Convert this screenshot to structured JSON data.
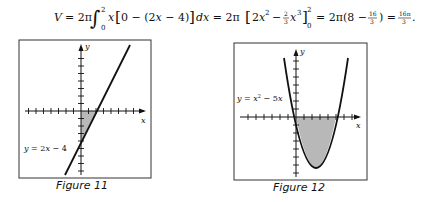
{
  "equation": {
    "lhs": "V",
    "parts": [
      "V = 2π",
      "∫",
      "2",
      "0",
      "x[0 − (2x − 4)] dx = 2π",
      "[2x",
      "2",
      " − ",
      "2",
      "3",
      "x",
      "3",
      "]",
      "2",
      "0",
      " = 2π(8 − ",
      "16",
      "3",
      ") = ",
      "16π",
      "3",
      "."
    ],
    "text": "V = 2π ∫₀² x[0 − (2x − 4)] dx = 2π[2x² − (2/3)x³]₀² = 2π(8 − 16/3) = 16π/3."
  },
  "figures": [
    {
      "caption": "Figure 11",
      "label": "y = 2x − 4",
      "x_axis_label": "x",
      "y_axis_label": "y",
      "function": "2x - 4",
      "shaded_region": "between y = 2x − 4 and x-axis for 0 ≤ x ≤ 2",
      "shade_color": "#b8b8b8"
    },
    {
      "caption": "Figure 12",
      "label_y": "y = x",
      "label_exp": "2",
      "label_rest": " − 5x",
      "x_axis_label": "x",
      "y_axis_label": "y",
      "function": "x^2 - 5x",
      "shaded_region": "between y = x² − 5x and x-axis for 0 ≤ x ≤ 5",
      "shade_color": "#b8b8b8"
    }
  ]
}
